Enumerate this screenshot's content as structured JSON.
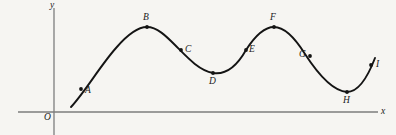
{
  "figure": {
    "title": "",
    "background_color": "#f6f5f2",
    "curve_color": "#141414",
    "axis_color": "#7d7d7d",
    "label_color": "#1a1a1a"
  },
  "axes": {
    "origin_label": "O",
    "x_axis_label": "x",
    "y_axis_label": "y",
    "x_axis": {
      "x1": 18,
      "x2": 378,
      "y": 112
    },
    "y_axis": {
      "x": 54,
      "y1": 8,
      "y2": 135
    },
    "grid": false
  },
  "chart_data": {
    "type": "line",
    "title": "",
    "xlabel": "x",
    "ylabel": "y",
    "grid": false,
    "legend": "none",
    "axis_origin_label": "O",
    "note": "Smooth wave-like curve rising from near the x-axis with labelled points A through I marking successive positions along the curve.",
    "xlim": [
      18,
      378
    ],
    "ylim": [
      8,
      112
    ],
    "curve_path": "M 71,107 C 85,92 100,66 116,48 C 128,34 139,27 147,27 C 157,27 166,36 175,45 C 186,56 198,70 213,73 C 226,75 237,66 246,50 C 255,36 264,27 274,27 C 285,27 295,38 305,54 C 316,71 332,91 347,92 C 358,92 367,79 375,58",
    "points": [
      {
        "label": "A",
        "x": 81,
        "y": 89,
        "label_x": 85,
        "label_y": 86
      },
      {
        "label": "B",
        "x": 147,
        "y": 27,
        "label_x": 143,
        "label_y": 13
      },
      {
        "label": "C",
        "x": 181,
        "y": 50,
        "label_x": 185,
        "label_y": 45
      },
      {
        "label": "D",
        "x": 213,
        "y": 73,
        "label_x": 209,
        "label_y": 77
      },
      {
        "label": "E",
        "x": 246,
        "y": 50,
        "label_x": 249,
        "label_y": 45
      },
      {
        "label": "F",
        "x": 274,
        "y": 27,
        "label_x": 270,
        "label_y": 13
      },
      {
        "label": "G",
        "x": 310,
        "y": 56,
        "label_x": 299,
        "label_y": 50
      },
      {
        "label": "H",
        "x": 347,
        "y": 92,
        "label_x": 343,
        "label_y": 96
      },
      {
        "label": "I",
        "x": 371,
        "y": 65,
        "label_x": 376,
        "label_y": 60
      }
    ]
  }
}
